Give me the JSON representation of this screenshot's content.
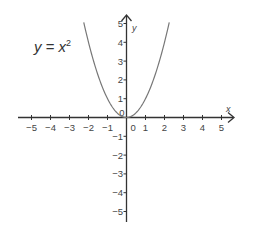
{
  "chart_data": {
    "type": "line",
    "title": "",
    "annotation": "y = x²",
    "equation": {
      "lhs": "y",
      "eq": "=",
      "base": "x",
      "exp": "2"
    },
    "xlabel": "x",
    "ylabel": "y",
    "xlim": [
      -5.5,
      5.5
    ],
    "ylim": [
      -5.5,
      5.5
    ],
    "xticks": [
      -5,
      -4,
      -3,
      -2,
      -1,
      0,
      1,
      2,
      3,
      4,
      5
    ],
    "yticks": [
      -5,
      -4,
      -3,
      -2,
      -1,
      0,
      1,
      2,
      3,
      4,
      5
    ],
    "grid": false,
    "series": [
      {
        "name": "y = x^2",
        "x": [
          -2.25,
          -2,
          -1.5,
          -1,
          -0.5,
          0,
          0.5,
          1,
          1.5,
          2,
          2.25
        ],
        "y": [
          5.06,
          4,
          2.25,
          1,
          0.25,
          0,
          0.25,
          1,
          2.25,
          4,
          5.06
        ]
      }
    ],
    "colors": {
      "axis": "#333333",
      "curve": "#777777",
      "text": "#444444"
    }
  }
}
